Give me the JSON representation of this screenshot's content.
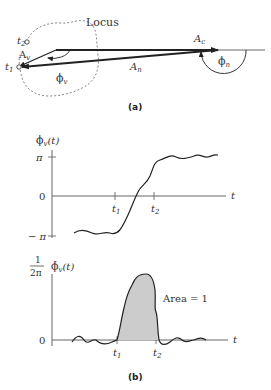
{
  "panel_a": {
    "caption": "(a)",
    "locus_label": "Locus",
    "t2_label": "t",
    "t2_sub": "2",
    "t1_label": "t",
    "t1_sub": "1",
    "Av_label": "A",
    "Av_sub": "v",
    "phi_v_label": "ϕ",
    "phi_v_sub": "v",
    "An_label": "A",
    "An_sub": "n",
    "Ac_label": "A",
    "Ac_sub": "c",
    "phi_n_label": "ϕ",
    "phi_n_sub": "n"
  },
  "panel_b": {
    "caption": "(b)",
    "top_plot": {
      "ylabel": "ϕ",
      "ylabel_sub": "v",
      "ylabel_arg": "(t)",
      "ytick_pi": "π",
      "ytick_zero": "0",
      "ytick_minus_pi": "− π",
      "xtick_t1": "t",
      "xtick_t1_sub": "1",
      "xtick_t2": "t",
      "xtick_t2_sub": "2",
      "xlabel": "t"
    },
    "bottom_plot": {
      "ylabel_frac_num": "1",
      "ylabel_frac_den": "2π",
      "ylabel": "ϕ̇",
      "ylabel_sub": "v",
      "ylabel_arg": "(t)",
      "ytick_zero": "0",
      "xtick_t1": "t",
      "xtick_t1_sub": "1",
      "xtick_t2": "t",
      "xtick_t2_sub": "2",
      "xlabel": "t",
      "annotation": "Area = 1"
    }
  },
  "colors": {
    "ink": "#222222",
    "axis": "#555555",
    "fill": "#cccccc"
  }
}
